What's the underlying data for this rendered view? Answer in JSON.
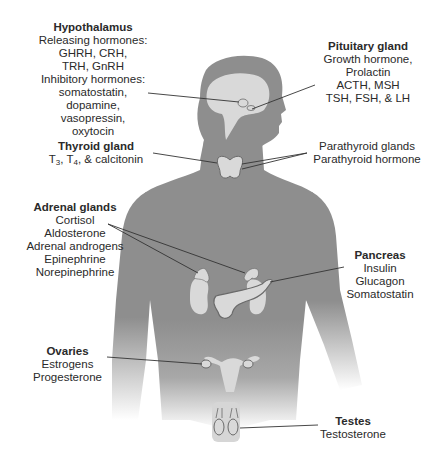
{
  "diagram": {
    "colors": {
      "body": "#8e8e8e",
      "organ": "#d9d9d9",
      "organ_outline": "#6a6a6a",
      "leader_line": "#333333",
      "text": "#2a2a2a"
    },
    "glands": [
      {
        "id": "hypothalamus",
        "title": "Hypothalamus",
        "lines": [
          "Releasing hormones:",
          "GHRH, CRH,",
          "TRH, GnRH",
          "Inhibitory hormones:",
          "somatostatin,",
          "dopamine,",
          "vasopressin,",
          "oxytocin"
        ]
      },
      {
        "id": "pituitary",
        "title": "Pituitary gland",
        "lines": [
          "Growth hormone,",
          "Prolactin",
          "ACTH, MSH",
          "TSH, FSH, & LH"
        ]
      },
      {
        "id": "thyroid",
        "title": "Thyroid gland",
        "lines": [
          "T3, T4, & calcitonin"
        ],
        "line_parts": {
          "t": "T",
          "sub3": "3",
          "sep": ", T",
          "sub4": "4",
          "rest": ", & calcitonin"
        }
      },
      {
        "id": "parathyroid",
        "title": "",
        "lines": [
          "Parathyroid glands",
          "Parathyroid hormone"
        ]
      },
      {
        "id": "adrenal",
        "title": "Adrenal glands",
        "lines": [
          "Cortisol",
          "Aldosterone",
          "Adrenal androgens",
          "Epinephrine",
          "Norepinephrine"
        ]
      },
      {
        "id": "pancreas",
        "title": "Pancreas",
        "lines": [
          "Insulin",
          "Glucagon",
          "Somatostatin"
        ]
      },
      {
        "id": "ovaries",
        "title": "Ovaries",
        "lines": [
          "Estrogens",
          "Progesterone"
        ]
      },
      {
        "id": "testes",
        "title": "Testes",
        "lines": [
          "Testosterone"
        ]
      }
    ]
  }
}
